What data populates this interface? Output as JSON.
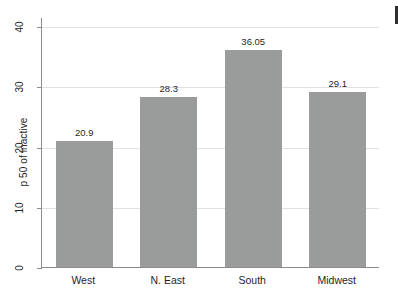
{
  "chart_data": {
    "type": "bar",
    "title": "",
    "subtitle": "",
    "xlabel": "",
    "ylabel": "p 50 of inactive",
    "categories": [
      "West",
      "N. East",
      "South",
      "Midwest"
    ],
    "values": [
      20.9,
      28.3,
      36.05,
      29.1
    ],
    "value_labels": [
      "20.9",
      "28.3",
      "36.05",
      "29.1"
    ],
    "ylim": [
      0,
      41.5
    ],
    "yticks": [
      0,
      10,
      20,
      30,
      40
    ],
    "ytick_labels": [
      "0",
      "10",
      "20",
      "30",
      "40"
    ],
    "grid": true,
    "grid_axis": "y",
    "legend": null,
    "bar_color": "#9a9b9b",
    "axis_color": "#8c8c8c",
    "grid_color": "#e2e2e2",
    "background": "#ffffff"
  },
  "figure": {
    "edge_marker_name": "window-edge-sliver"
  }
}
